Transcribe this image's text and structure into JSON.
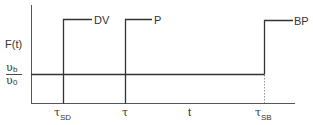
{
  "diagram": {
    "y_axis_label": "F(t)",
    "x_axis_label": "t",
    "level_labels": {
      "upper": {
        "symbol": "υ",
        "subscript": "b"
      },
      "lower": {
        "symbol": "υ",
        "subscript": "0"
      }
    },
    "steps": [
      {
        "label": "DV",
        "tick_symbol": "τ",
        "tick_subscript": "SD"
      },
      {
        "label": "P",
        "tick_symbol": "τ",
        "tick_subscript": ""
      },
      {
        "label": "BP",
        "tick_symbol": "τ",
        "tick_subscript": "SB"
      }
    ],
    "colors": {
      "line": "#333333",
      "dotted": "#777777"
    }
  }
}
